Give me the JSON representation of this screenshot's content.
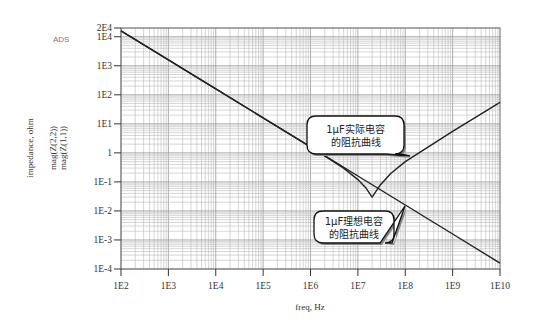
{
  "header": {
    "tool_label": "ADS"
  },
  "chart_data": {
    "type": "line",
    "title": "",
    "xlabel": "freq, Hz",
    "ylabel": "impedance, ohm",
    "ylabel_series": [
      "mag(Z(2,2))",
      "mag(Z(1,1))"
    ],
    "xscale": "log",
    "yscale": "log",
    "xlim": [
      100,
      10000000000
    ],
    "ylim": [
      0.0001,
      20000
    ],
    "x_ticks": [
      "1E2",
      "1E3",
      "1E4",
      "1E5",
      "1E6",
      "1E7",
      "1E8",
      "1E9",
      "1E10"
    ],
    "x_tick_values": [
      100.0,
      1000.0,
      10000.0,
      100000.0,
      1000000.0,
      10000000.0,
      100000000.0,
      1000000000.0,
      10000000000.0
    ],
    "y_ticks": [
      "2E4",
      "1E4",
      "1E3",
      "1E2",
      "1E1",
      "1",
      "1E-1",
      "1E-2",
      "1E-3",
      "1E-4"
    ],
    "y_tick_values": [
      20000,
      10000,
      1000,
      100,
      10,
      1,
      0.1,
      0.01,
      0.001,
      0.0001
    ],
    "grid": true,
    "series": [
      {
        "name": "mag(Z(1,1))",
        "description": "ideal capacitor",
        "x": [
          100,
          1000,
          10000,
          100000,
          1000000,
          10000000,
          100000000,
          1000000000,
          10000000000
        ],
        "y": [
          16000,
          1600,
          160,
          16,
          1.6,
          0.16,
          0.016,
          0.0016,
          0.00016
        ]
      },
      {
        "name": "mag(Z(2,2))",
        "description": "real capacitor",
        "x": [
          100,
          1000,
          10000,
          100000,
          1000000,
          5000000,
          10000000,
          15000000,
          20000000,
          30000000,
          50000000,
          100000000,
          1000000000,
          10000000000
        ],
        "y": [
          16000,
          1600,
          160,
          16,
          1.6,
          0.3,
          0.12,
          0.06,
          0.03,
          0.08,
          0.2,
          0.5,
          5.5,
          55
        ]
      }
    ],
    "annotations": [
      {
        "line1": "1μF实际电容",
        "line2": "的阻抗曲线",
        "target": "mag(Z(2,2))",
        "position": "center-right"
      },
      {
        "line1": "1μF理想电容",
        "line2": "的阻抗曲线",
        "target": "mag(Z(1,1))",
        "position": "bottom-center-right"
      }
    ]
  }
}
